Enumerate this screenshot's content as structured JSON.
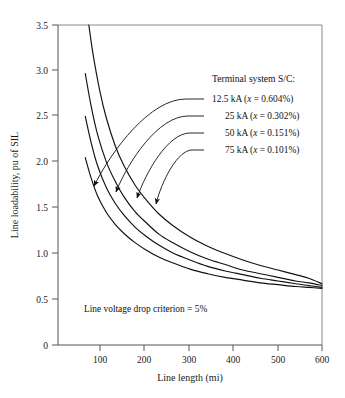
{
  "chart_data": {
    "type": "line",
    "title": "",
    "xlabel": "Line length (mi)",
    "ylabel": "Line loadability, pu of SIL",
    "xlim": [
      0,
      600
    ],
    "ylim": [
      0,
      3.5
    ],
    "xticks": [
      100,
      200,
      300,
      400,
      500,
      600
    ],
    "xtick_labels": [
      "100",
      "200",
      "300",
      "400",
      "500",
      "600"
    ],
    "yticks": [
      0,
      0.5,
      1.0,
      1.5,
      2.0,
      2.5,
      3.0,
      3.5
    ],
    "ytick_labels": [
      "0",
      "0.5",
      "1.0",
      "1.5",
      "2.0",
      "2.5",
      "3.0",
      "3.5"
    ],
    "grid": false,
    "legend_position": "upper-right-inside",
    "legend_title": "Terminal system S/C:",
    "annotation": "Line voltage drop criterion = 5%",
    "series": [
      {
        "name": "12.5 kA (x = 0.604%)",
        "legend_label": "12.5 kA",
        "legend_param": "(x = 0.604%)",
        "x": [
          62,
          75,
          90,
          110,
          130,
          150,
          175,
          200,
          230,
          260,
          300,
          340,
          380,
          420,
          460,
          500,
          540,
          570,
          600
        ],
        "y": [
          2.05,
          1.83,
          1.63,
          1.45,
          1.32,
          1.22,
          1.12,
          1.04,
          0.96,
          0.9,
          0.83,
          0.78,
          0.74,
          0.71,
          0.68,
          0.66,
          0.64,
          0.63,
          0.62
        ]
      },
      {
        "name": "25 kA (x = 0.302%)",
        "legend_label": "25 kA",
        "legend_param": "(x = 0.302%)",
        "x": [
          62,
          75,
          90,
          110,
          130,
          150,
          175,
          200,
          230,
          260,
          300,
          340,
          380,
          420,
          460,
          500,
          540,
          570,
          600
        ],
        "y": [
          2.5,
          2.22,
          1.96,
          1.72,
          1.55,
          1.42,
          1.29,
          1.19,
          1.09,
          1.01,
          0.93,
          0.86,
          0.81,
          0.77,
          0.73,
          0.7,
          0.67,
          0.65,
          0.63
        ]
      },
      {
        "name": "50 kA (x = 0.151%)",
        "legend_label": "50 kA",
        "legend_param": "(x = 0.151%)",
        "x": [
          62,
          75,
          90,
          110,
          130,
          150,
          175,
          200,
          230,
          260,
          300,
          340,
          380,
          420,
          460,
          500,
          540,
          570,
          600
        ],
        "y": [
          2.97,
          2.62,
          2.3,
          2.0,
          1.79,
          1.62,
          1.46,
          1.34,
          1.21,
          1.12,
          1.02,
          0.94,
          0.88,
          0.82,
          0.78,
          0.74,
          0.7,
          0.68,
          0.65
        ]
      },
      {
        "name": "75 kA (x = 0.101%)",
        "legend_label": "75 kA",
        "legend_param": "(x = 0.101%)",
        "x": [
          70,
          80,
          95,
          110,
          130,
          150,
          175,
          200,
          230,
          260,
          300,
          340,
          380,
          420,
          460,
          500,
          540,
          570,
          600
        ],
        "y": [
          3.5,
          3.17,
          2.78,
          2.48,
          2.18,
          1.96,
          1.75,
          1.59,
          1.43,
          1.31,
          1.18,
          1.08,
          1.0,
          0.93,
          0.87,
          0.82,
          0.77,
          0.73,
          0.67
        ]
      }
    ]
  },
  "axes": {
    "xlabel": "Line length (mi)",
    "ylabel": "Line loadability, pu of SIL",
    "xticks": [
      "100",
      "200",
      "300",
      "400",
      "500",
      "600"
    ],
    "yticks": [
      "3.5",
      "3.0",
      "2.5",
      "2.0",
      "1.5",
      "1.0",
      "0.5",
      "0"
    ]
  },
  "legend": {
    "title": "Terminal system S/C:",
    "entries": [
      {
        "value": "12.5 kA ",
        "open": "(",
        "var": "x",
        "eq": " = 0.604%)"
      },
      {
        "value": "25 kA ",
        "open": "(",
        "var": "x",
        "eq": " = 0.302%)"
      },
      {
        "value": "50 kA ",
        "open": "(",
        "var": "x",
        "eq": " = 0.151%)"
      },
      {
        "value": "75 kA ",
        "open": "(",
        "var": "x",
        "eq": " = 0.101%)"
      }
    ]
  },
  "annotation": {
    "text": "Line voltage drop criterion = 5%"
  },
  "colors": {
    "curve": "#111111",
    "axis": "#555555",
    "frame": "#8a8a8a",
    "background": "#ffffff"
  }
}
